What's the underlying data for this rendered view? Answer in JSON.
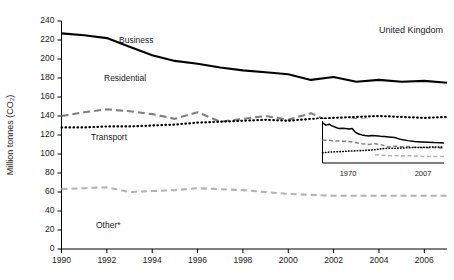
{
  "chart_data": {
    "type": "line",
    "title": "",
    "annotation": "United Kingdom",
    "xlabel": "",
    "ylabel": "Million tonnes (CO₂)",
    "xlim": [
      1990,
      2007
    ],
    "ylim": [
      0,
      240
    ],
    "grid": false,
    "legend_position": "inline-labels",
    "x": [
      1990,
      1991,
      1992,
      1993,
      1994,
      1995,
      1996,
      1997,
      1998,
      1999,
      2000,
      2001,
      2002,
      2003,
      2004,
      2005,
      2006,
      2007
    ],
    "x_tick_labels": [
      "1990",
      "1992",
      "1994",
      "1996",
      "1998",
      "2000",
      "2002",
      "2004",
      "2006"
    ],
    "x_ticks": [
      1990,
      1992,
      1994,
      1996,
      1998,
      2000,
      2002,
      2004,
      2006
    ],
    "y_ticks": [
      0,
      20,
      40,
      60,
      80,
      100,
      120,
      140,
      160,
      180,
      200,
      220,
      240
    ],
    "y_tick_labels": [
      "0",
      "20",
      "40",
      "60",
      "80",
      "100",
      "120",
      "140",
      "160",
      "180",
      "200",
      "220",
      "240"
    ],
    "series": [
      {
        "name": "Business",
        "label": "Business",
        "style": "solid",
        "color": "#000000",
        "values": [
          227,
          225,
          222,
          213,
          204,
          198,
          195,
          191,
          188,
          186,
          184,
          178,
          181,
          176,
          178,
          176,
          177,
          175
        ]
      },
      {
        "name": "Residential",
        "label": "Residential",
        "style": "dashed",
        "color": "#808080",
        "values": [
          140,
          144,
          147,
          145,
          142,
          137,
          144,
          134,
          137,
          140,
          136,
          143,
          132,
          137,
          135,
          134,
          131,
          133
        ]
      },
      {
        "name": "Transport",
        "label": "Transport",
        "style": "dotted",
        "color": "#000000",
        "values": [
          128,
          128,
          129,
          129,
          130,
          131,
          133,
          134,
          135,
          136,
          135,
          137,
          138,
          139,
          140,
          139,
          138,
          139
        ]
      },
      {
        "name": "Other",
        "label": "Other*",
        "style": "dashed",
        "color": "#b3b3b3",
        "values": [
          63,
          64,
          65,
          60,
          61,
          62,
          64,
          63,
          62,
          60,
          58,
          57,
          56,
          56,
          56,
          56,
          56,
          56
        ]
      }
    ],
    "inset": {
      "xlim": [
        1970,
        2007
      ],
      "x_tick_labels": [
        "1970",
        "2007"
      ],
      "x_ticks": [
        1970,
        2007
      ],
      "series": [
        {
          "name": "Business",
          "style": "solid",
          "color": "#000000",
          "x": [
            1970,
            1971,
            1972,
            1973,
            1974,
            1975,
            1976,
            1977,
            1978,
            1979,
            1980,
            1981,
            1982,
            1983,
            1984,
            1985,
            1986,
            1987,
            1988,
            1989,
            1990,
            1992,
            1994,
            1996,
            1998,
            2000,
            2002,
            2004,
            2006,
            2007
          ],
          "values": [
            352,
            330,
            338,
            322,
            312,
            300,
            303,
            300,
            296,
            300,
            268,
            252,
            245,
            240,
            236,
            240,
            238,
            236,
            232,
            230,
            227,
            222,
            204,
            195,
            188,
            184,
            181,
            178,
            177,
            175
          ]
        },
        {
          "name": "Residential",
          "style": "dashed",
          "color": "#808080",
          "x": [
            1970,
            1972,
            1974,
            1976,
            1978,
            1980,
            1982,
            1984,
            1986,
            1988,
            1990,
            1992,
            1994,
            1996,
            1998,
            2000,
            2002,
            2004,
            2006,
            2007
          ],
          "values": [
            200,
            198,
            192,
            190,
            188,
            178,
            168,
            162,
            168,
            158,
            140,
            147,
            142,
            144,
            137,
            136,
            132,
            135,
            131,
            133
          ]
        },
        {
          "name": "Transport",
          "style": "dotted",
          "color": "#000000",
          "x": [
            1970,
            1972,
            1974,
            1976,
            1978,
            1980,
            1982,
            1984,
            1986,
            1988,
            1990,
            1992,
            1994,
            1996,
            1998,
            2000,
            2002,
            2004,
            2006,
            2007
          ],
          "values": [
            88,
            95,
            98,
            100,
            104,
            106,
            108,
            112,
            116,
            124,
            128,
            129,
            130,
            133,
            135,
            135,
            138,
            140,
            138,
            139
          ]
        },
        {
          "name": "Other",
          "style": "dashed",
          "color": "#b3b3b3",
          "x": [
            1986,
            1988,
            1990,
            1992,
            1994,
            1996,
            1998,
            2000,
            2002,
            2004,
            2006,
            2007
          ],
          "values": [
            72,
            68,
            63,
            65,
            61,
            64,
            62,
            58,
            56,
            56,
            56,
            56
          ]
        }
      ]
    }
  }
}
